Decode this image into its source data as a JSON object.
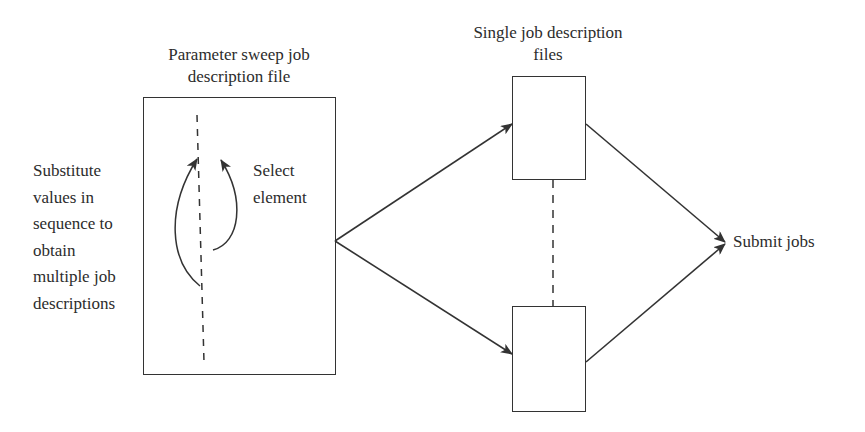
{
  "diagram": {
    "type": "flow",
    "colors": {
      "stroke": "#333333",
      "text": "#2c2c2c",
      "background": "#ffffff"
    },
    "nodes": {
      "sweep_file": {
        "title_line1": "Parameter sweep job",
        "title_line2": "description file"
      },
      "substitute_note": {
        "lines": [
          "Substitute",
          "values in",
          "sequence to",
          "obtain",
          "multiple job",
          "descriptions"
        ]
      },
      "select_note": {
        "lines": [
          "Select",
          "element"
        ]
      },
      "single_files": {
        "title_line1": "Single job description",
        "title_line2": "files"
      },
      "submit": {
        "label": "Submit jobs"
      }
    },
    "edges": [
      {
        "from": "sweep_file",
        "to": "single_file_top",
        "style": "arrow"
      },
      {
        "from": "sweep_file",
        "to": "single_file_bottom",
        "style": "arrow"
      },
      {
        "from": "single_file_top",
        "to": "submit",
        "style": "arrow"
      },
      {
        "from": "single_file_bottom",
        "to": "submit",
        "style": "arrow"
      },
      {
        "from": "single_file_top",
        "to": "single_file_bottom",
        "style": "dashed"
      }
    ]
  }
}
